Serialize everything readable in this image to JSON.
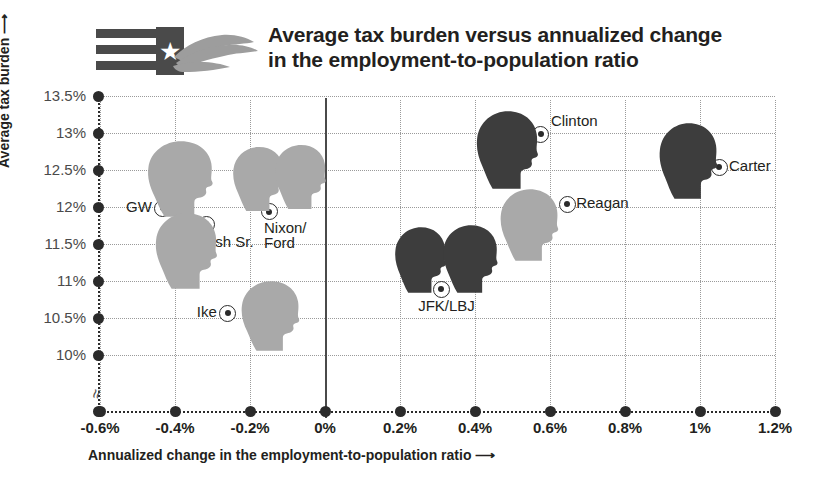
{
  "header": {
    "title": "Average tax burden versus annualized change in the employment-to-population ratio",
    "title_line1": "Average tax burden versus annualized change",
    "title_line2": "in the employment-to-population ratio",
    "logo": {
      "icon": "flag-with-star-and-hand-logo",
      "star": "★"
    }
  },
  "chart_data": {
    "type": "scatter",
    "title": "Average tax burden versus annualized change in the employment-to-population ratio",
    "xlabel": "Annualized change in the employment-to-population ratio",
    "ylabel": "Average tax burden",
    "xlabel_arrow": "⟶",
    "ylabel_arrow": "⟶",
    "xlim": [
      -0.6,
      1.2
    ],
    "ylim": [
      10.0,
      13.5
    ],
    "y_axis_break": true,
    "grid": true,
    "xticks": [
      -0.6,
      -0.4,
      -0.2,
      0,
      0.2,
      0.4,
      0.6,
      0.8,
      1,
      1.2
    ],
    "xticklabels": [
      "-0.6%",
      "-0.4%",
      "-0.2%",
      "0%",
      "0.2%",
      "0.4%",
      "0.6%",
      "0.8%",
      "1%",
      "1.2%"
    ],
    "yticks": [
      10,
      10.5,
      11,
      11.5,
      12,
      12.5,
      13,
      13.5
    ],
    "yticklabels": [
      "10%",
      "10.5%",
      "11%",
      "11.5%",
      "12%",
      "12.5%",
      "13%",
      "13.5%"
    ],
    "points": [
      {
        "name": "GW",
        "x": -0.435,
        "y": 12.0,
        "shade": "light",
        "label_side": "left",
        "label_dx": -10,
        "label_dy": 0
      },
      {
        "name": "Bush Sr.",
        "x": -0.32,
        "y": 11.78,
        "shade": "light",
        "label_side": "below",
        "label_dx": -8,
        "label_dy": 11
      },
      {
        "name": "Nixon/\nFord",
        "x": -0.152,
        "y": 11.95,
        "shade": "light",
        "label_side": "below",
        "label_dx": -4,
        "label_dy": 9
      },
      {
        "name": "Ike",
        "x": -0.262,
        "y": 10.58,
        "shade": "light",
        "label_side": "left",
        "label_dx": -10,
        "label_dy": 0
      },
      {
        "name": "JFK/LBJ",
        "x": 0.307,
        "y": 10.9,
        "shade": "dark",
        "label_side": "below",
        "label_dx": -22,
        "label_dy": 10
      },
      {
        "name": "Clinton",
        "x": 0.573,
        "y": 13.0,
        "shade": "dark",
        "label_side": "right",
        "label_dx": 11,
        "label_dy": -12
      },
      {
        "name": "Reagan",
        "x": 0.643,
        "y": 12.05,
        "shade": "light",
        "label_side": "right",
        "label_dx": 10,
        "label_dy": 0
      },
      {
        "name": "Carter",
        "x": 1.048,
        "y": 12.55,
        "shade": "dark",
        "label_side": "right",
        "label_dx": 11,
        "label_dy": 0
      }
    ],
    "silhouettes": [
      {
        "for": "GW",
        "shade": "light",
        "x": 144,
        "y": 140,
        "w": 74,
        "h": 78,
        "flip": false
      },
      {
        "for": "Bush Sr.",
        "shade": "light",
        "x": 152,
        "y": 212,
        "w": 70,
        "h": 78,
        "flip": false
      },
      {
        "for": "Nixon",
        "shade": "light",
        "x": 230,
        "y": 146,
        "w": 58,
        "h": 66,
        "flip": false
      },
      {
        "for": "Ford",
        "shade": "light",
        "x": 272,
        "y": 144,
        "w": 58,
        "h": 66,
        "flip": false
      },
      {
        "for": "Ike",
        "shade": "light",
        "x": 238,
        "y": 280,
        "w": 66,
        "h": 72,
        "flip": false
      },
      {
        "for": "JFK",
        "shade": "dark",
        "x": 392,
        "y": 226,
        "w": 58,
        "h": 68,
        "flip": false
      },
      {
        "for": "LBJ",
        "shade": "dark",
        "x": 440,
        "y": 224,
        "w": 62,
        "h": 70,
        "flip": false
      },
      {
        "for": "Clinton",
        "shade": "dark",
        "x": 473,
        "y": 110,
        "w": 70,
        "h": 80,
        "flip": false
      },
      {
        "for": "Reagan",
        "shade": "light",
        "x": 497,
        "y": 188,
        "w": 66,
        "h": 74,
        "flip": false
      },
      {
        "for": "Carter",
        "shade": "dark",
        "x": 656,
        "y": 122,
        "w": 66,
        "h": 78,
        "flip": false
      }
    ]
  },
  "colors": {
    "silhouette_dark": "#3d3d3d",
    "silhouette_light": "#a9a9a9",
    "grid": "#9a9a9a",
    "axis": "#2b2b2b",
    "text": "#231f20",
    "tick_text": "#4a4a4a",
    "logo_gray": "#4a4a4a",
    "hand_gray": "#9d9d9d"
  }
}
